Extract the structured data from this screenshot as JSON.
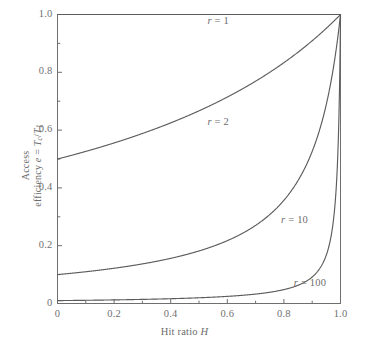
{
  "chart_data": {
    "type": "line",
    "title": "",
    "xlabel": "Hit ratio H",
    "ylabel": "Access efficiency e = Tc/T1",
    "xlim": [
      0,
      1
    ],
    "ylim": [
      0,
      1
    ],
    "grid": false,
    "legend_position": "inline-curve-labels",
    "formula": "e = 1 / (r - (r - 1) H)",
    "xticks": [
      "0",
      "0.2",
      "0.4",
      "0.6",
      "0.8",
      "1.0"
    ],
    "xtick_values": [
      0,
      0.2,
      0.4,
      0.6,
      0.8,
      1.0
    ],
    "yticks": [
      "0",
      "0.2",
      "0.4",
      "0.6",
      "0.8",
      "1.0"
    ],
    "ytick_values": [
      0,
      0.2,
      0.4,
      0.6,
      0.8,
      1.0
    ],
    "x": [
      0,
      0.05,
      0.1,
      0.15,
      0.2,
      0.25,
      0.3,
      0.35,
      0.4,
      0.45,
      0.5,
      0.55,
      0.6,
      0.65,
      0.7,
      0.75,
      0.8,
      0.85,
      0.9,
      0.92,
      0.94,
      0.95,
      0.96,
      0.97,
      0.98,
      0.985,
      0.99,
      0.995,
      1.0
    ],
    "series": [
      {
        "name": "r = 1",
        "r": 1,
        "label": "r = 1",
        "label_x": 0.53,
        "label_y": 0.975,
        "values": [
          1,
          1,
          1,
          1,
          1,
          1,
          1,
          1,
          1,
          1,
          1,
          1,
          1,
          1,
          1,
          1,
          1,
          1,
          1,
          1,
          1,
          1,
          1,
          1,
          1,
          1,
          1,
          1,
          1
        ]
      },
      {
        "name": "r = 2",
        "r": 2,
        "label": "r = 2",
        "label_x": 0.53,
        "label_y": 0.625,
        "values": [
          0.5,
          0.513,
          0.526,
          0.541,
          0.556,
          0.571,
          0.588,
          0.606,
          0.625,
          0.645,
          0.667,
          0.69,
          0.714,
          0.741,
          0.769,
          0.8,
          0.833,
          0.87,
          0.909,
          0.926,
          0.943,
          0.952,
          0.962,
          0.971,
          0.98,
          0.985,
          0.99,
          0.995,
          1.0
        ]
      },
      {
        "name": "r = 10",
        "r": 10,
        "label": "r = 10",
        "label_x": 0.79,
        "label_y": 0.285,
        "values": [
          0.1,
          0.104,
          0.109,
          0.114,
          0.119,
          0.125,
          0.132,
          0.14,
          0.149,
          0.159,
          0.182,
          0.196,
          0.217,
          0.241,
          0.27,
          0.308,
          0.357,
          0.426,
          0.526,
          0.581,
          0.649,
          0.69,
          0.735,
          0.787,
          0.847,
          0.88,
          0.917,
          0.957,
          1.0
        ]
      },
      {
        "name": "r = 100",
        "r": 100,
        "label": "r = 100",
        "label_x": 0.835,
        "label_y": 0.068,
        "values": [
          0.01,
          0.0104,
          0.0109,
          0.0114,
          0.012,
          0.0127,
          0.0134,
          0.0142,
          0.0152,
          0.0162,
          0.0174,
          0.0187,
          0.0203,
          0.0221,
          0.0242,
          0.0268,
          0.0299,
          0.0339,
          0.0917,
          0.112,
          0.144,
          0.168,
          0.2,
          0.249,
          0.336,
          0.408,
          0.503,
          0.669,
          1.0
        ]
      }
    ]
  },
  "axes": {
    "x_title_text": "Hit ratio ",
    "x_title_symbol": "H",
    "y_title_line1": "Access",
    "y_title_line2_a": "efficiency ",
    "y_title_line2_e": "e",
    "y_title_line2_eq": " = ",
    "y_title_line2_tc": "T",
    "y_title_line2_tc_sub": "c",
    "y_title_line2_slash": "/",
    "y_title_line2_t1": "T",
    "y_title_line2_t1_sub": "1"
  },
  "style": {
    "axis_color": "#6f6f6f",
    "curve_color": "#5c5c5c",
    "text_color": "#6d6d6d",
    "background": "#ffffff"
  }
}
